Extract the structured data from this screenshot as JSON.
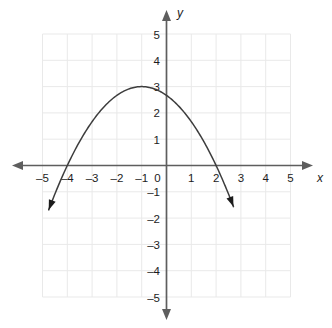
{
  "chart_data": {
    "type": "line",
    "title": "",
    "subtitle": "",
    "xlabel": "x",
    "ylabel": "y",
    "xlim": [
      -5.5,
      5.5
    ],
    "ylim": [
      -5.5,
      5.5
    ],
    "grid": true,
    "legend": null,
    "x_ticks": [
      -5,
      -4,
      -3,
      -2,
      -1,
      0,
      1,
      2,
      3,
      4,
      5
    ],
    "y_ticks": [
      5,
      4,
      3,
      2,
      1,
      0,
      -1,
      -2,
      -3,
      -4,
      -5
    ],
    "x_tick_labels": [
      "-5",
      "-4",
      "-3",
      "-2",
      "-1",
      "0",
      "1",
      "2",
      "3",
      "4",
      "5"
    ],
    "y_tick_labels": [
      "5",
      "4",
      "3",
      "2",
      "1",
      "0",
      "-1",
      "-2",
      "-3",
      "-4",
      "-5"
    ],
    "series": [
      {
        "name": "parabola",
        "equation": "y = -(1/3)(x + 4)(x - 2)",
        "vertex": [
          -1,
          3
        ],
        "roots": [
          -4,
          2
        ],
        "y_intercept": 2.667,
        "opens": "down",
        "arrow_start": [
          -4.75,
          -2.05
        ],
        "arrow_end": [
          2.7,
          -2.1
        ],
        "x": [
          -4.75,
          -4.5,
          -4.25,
          -4,
          -3.75,
          -3.5,
          -3.25,
          -3,
          -2.75,
          -2.5,
          -2.25,
          -2,
          -1.75,
          -1.5,
          -1.25,
          -1,
          -0.75,
          -0.5,
          -0.25,
          0,
          0.25,
          0.5,
          0.75,
          1,
          1.25,
          1.5,
          1.75,
          2,
          2.25,
          2.5,
          2.7
        ],
        "values": [
          -2.06,
          -1.46,
          -0.94,
          -0.5,
          -0.15,
          0.12,
          0.31,
          0.44,
          0.48,
          0.45,
          0.35,
          0.17,
          -0.08,
          -0.42,
          -0.83,
          3,
          2.98,
          2.92,
          2.81,
          2.67,
          2.48,
          2.25,
          1.98,
          1.67,
          1.31,
          0.92,
          0.48,
          0,
          -0.52,
          -1.08,
          -1.56
        ]
      }
    ],
    "colors": {
      "curve": "#3d3d3d",
      "axis": "#5e5e5e",
      "grid": "#e9e9e9",
      "label": "#1c1c1c",
      "background": "#ffffff"
    }
  },
  "axes": {
    "x_label": "x",
    "y_label": "y"
  }
}
